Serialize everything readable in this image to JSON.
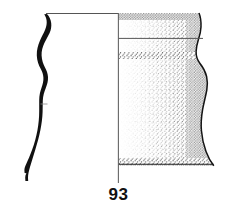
{
  "figure": {
    "catalogue_number": "93",
    "type": "archaeological-pottery-profile-drawing",
    "ink_color": "#111111",
    "background_color": "#ffffff",
    "stipple_color": "#1a1a1a"
  },
  "geometry": {
    "canvas": {
      "width": 235,
      "height": 218
    },
    "axis_line": {
      "x": 118,
      "y_top": 13,
      "y_bottom": 183
    },
    "rim_line": {
      "y": 13,
      "x_start": 38,
      "x_end": 200
    },
    "neck_line": {
      "y": 38,
      "x_start": 118,
      "x_end": 205
    },
    "base_line": {
      "y": 163,
      "x_start": 118,
      "x_end": 214
    },
    "section_profile": {
      "x_outer": 24,
      "x_inner": 56,
      "y_top": 14,
      "y_bottom": 181
    },
    "elevation_profile": {
      "x_axis": 118,
      "x_max_rim": 200,
      "x_min_waist": 196,
      "x_max_shoulder": 207,
      "x_max_base": 214,
      "y_top": 13,
      "y_bottom": 166
    }
  },
  "labels": {
    "number_label": "93"
  }
}
